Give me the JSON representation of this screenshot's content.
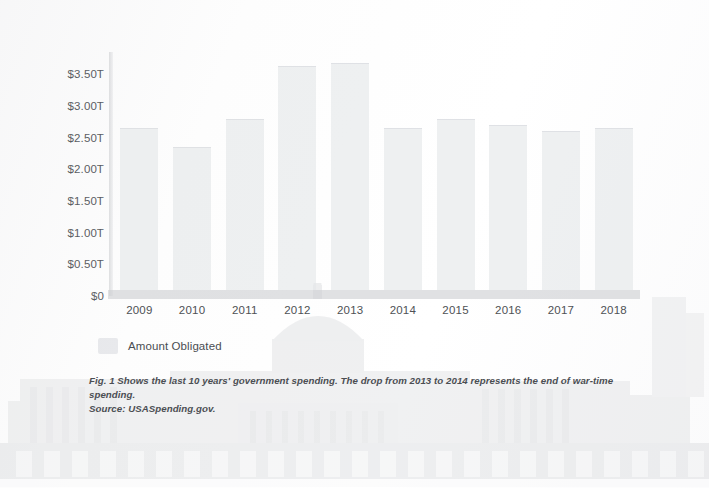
{
  "chart_data": {
    "type": "bar",
    "title": "",
    "subtitle": "",
    "xlabel": "",
    "ylabel": "",
    "categories": [
      "2009",
      "2010",
      "2011",
      "2012",
      "2013",
      "2014",
      "2015",
      "2016",
      "2017",
      "2018"
    ],
    "values": [
      2.6,
      2.3,
      2.75,
      3.6,
      3.65,
      2.6,
      2.75,
      2.65,
      2.55,
      2.6
    ],
    "series": [
      {
        "name": "Amount Obligated",
        "values": [
          2.6,
          2.3,
          2.75,
          3.6,
          3.65,
          2.6,
          2.75,
          2.65,
          2.55,
          2.6
        ]
      }
    ],
    "ylim": [
      0,
      3.85
    ],
    "ytick_values": [
      0,
      0.5,
      1.0,
      1.5,
      2.0,
      2.5,
      3.0,
      3.5
    ],
    "ytick_labels": [
      "$0",
      "$0.50T",
      "$1.00T",
      "$1.50T",
      "$2.00T",
      "$2.50T",
      "$3.00T",
      "$3.50T"
    ],
    "units": "Trillions of US Dollars",
    "grid": false,
    "legend_position": "bottom-left",
    "annotations": [
      "The drop from 2013 to 2014 represents the end of war-time spending."
    ]
  },
  "legend": {
    "swatch_name": "amount-obligated-swatch",
    "label": "Amount Obligated"
  },
  "caption": {
    "line1": "Fig. 1 Shows the last 10 years' government spending. The drop from 2013 to 2014 represents the end of war-time spending.",
    "line2": "Source: USASpending.gov."
  },
  "colors": {
    "bar": "#e4e6e9",
    "axis": "#cdcfd2",
    "text": "#4e5155",
    "background": "#fefefe"
  },
  "watermark": {
    "name": "capitol-building-watermark"
  }
}
